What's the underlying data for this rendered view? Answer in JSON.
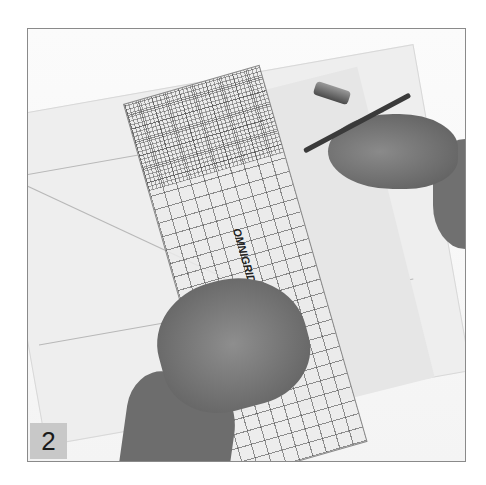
{
  "photo": {
    "description": "Hands placing a clear quilting ruler on pattern paper and marking with a pen",
    "ruler_text": "OMNIGRID 18\" ruler",
    "step_number": "2"
  },
  "colors": {
    "frame_border": "#8a8a8a",
    "badge_background": "#c8c8c8",
    "badge_text": "#1a1a1a"
  }
}
